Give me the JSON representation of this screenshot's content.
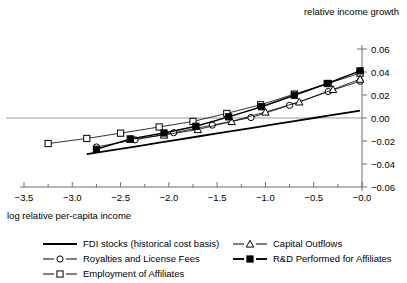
{
  "chart_data": {
    "type": "scatter",
    "title": "",
    "xlabel": "log relative per-capita income",
    "ylabel": "relative income growth",
    "xlim": [
      -3.6,
      0.05
    ],
    "ylim": [
      -0.065,
      0.065
    ],
    "xticks": [
      -3.5,
      -3.0,
      -2.5,
      -2.0,
      -1.5,
      -1.0,
      -0.5,
      -0.0
    ],
    "xticklabels": [
      "−3.5",
      "−3.0",
      "−2.5",
      "−2.0",
      "−1.5",
      "−1.0",
      "−0.5",
      "−0.0"
    ],
    "yticks": [
      -0.06,
      -0.04,
      -0.02,
      0.0,
      0.02,
      0.04,
      0.06
    ],
    "yticklabels": [
      "−0.06",
      "−0.04",
      "−0.02",
      "0.00",
      "0.02",
      "0.04",
      "0.06"
    ],
    "yaxis_position": "right",
    "grid": "zero-line-only",
    "zero_line_value": 0.0,
    "legend_position": "below",
    "series": [
      {
        "name": "FDI stocks (historical cost basis)",
        "marker": "none",
        "color": "#000000",
        "linewidth": 1.8,
        "x": [
          -2.85,
          -2.55,
          -2.3,
          -2.1,
          -1.9,
          -1.7,
          -1.5,
          -1.3,
          -1.1,
          -0.9,
          -0.7,
          -0.5,
          -0.3,
          -0.1,
          -0.02
        ],
        "y": [
          -0.0315,
          -0.0275,
          -0.0242,
          -0.0215,
          -0.0188,
          -0.0161,
          -0.0134,
          -0.0108,
          -0.0081,
          -0.0054,
          -0.0027,
          0.0,
          0.0027,
          0.0054,
          0.0065
        ]
      },
      {
        "name": "Royalties and License Fees",
        "marker": "open-circle",
        "color": "#000000",
        "linewidth": 0.8,
        "x": [
          -2.75,
          -2.35,
          -1.95,
          -1.55,
          -1.15,
          -0.75,
          -0.35,
          -0.02
        ],
        "y": [
          -0.0252,
          -0.019,
          -0.0128,
          -0.0062,
          0.0004,
          0.011,
          0.023,
          0.032
        ]
      },
      {
        "name": "Employment of Affiliates",
        "marker": "open-square",
        "color": "#000000",
        "linewidth": 0.8,
        "x": [
          -3.25,
          -2.85,
          -2.5,
          -2.1,
          -1.75,
          -1.4,
          -1.05,
          -0.7,
          -0.35,
          -0.02
        ],
        "y": [
          -0.0222,
          -0.0178,
          -0.0132,
          -0.0078,
          -0.003,
          0.004,
          0.0115,
          0.0208,
          0.03,
          0.039
        ]
      },
      {
        "name": "Capital Outflows",
        "marker": "open-triangle",
        "color": "#000000",
        "linewidth": 0.8,
        "x": [
          -2.4,
          -2.05,
          -1.7,
          -1.35,
          -1.0,
          -0.65,
          -0.3,
          -0.02
        ],
        "y": [
          -0.0185,
          -0.0148,
          -0.01,
          -0.003,
          0.0052,
          0.014,
          0.0248,
          0.0338
        ]
      },
      {
        "name": "R&D Performed for Affiliates",
        "marker": "filled-square",
        "color": "#000000",
        "linewidth": 1.4,
        "x": [
          -2.75,
          -2.4,
          -2.05,
          -1.72,
          -1.38,
          -1.04,
          -0.7,
          -0.36,
          -0.02
        ],
        "y": [
          -0.0272,
          -0.0182,
          -0.013,
          -0.0072,
          0.001,
          0.0098,
          0.0198,
          0.03,
          0.041
        ]
      }
    ]
  },
  "legend": {
    "columns": [
      {
        "entries": [
          {
            "label": "FDI stocks (historical cost basis)",
            "marker": "none",
            "thick": true
          },
          {
            "label": "Royalties and License Fees",
            "marker": "open-circle",
            "thick": false
          },
          {
            "label": "Employment of Affiliates",
            "marker": "open-square",
            "thick": false
          }
        ]
      },
      {
        "entries": [
          {
            "label": "Capital Outflows",
            "marker": "open-triangle",
            "thick": false
          },
          {
            "label": "R&D Performed for Affiliates",
            "marker": "filled-square",
            "thick": true
          }
        ]
      }
    ]
  }
}
